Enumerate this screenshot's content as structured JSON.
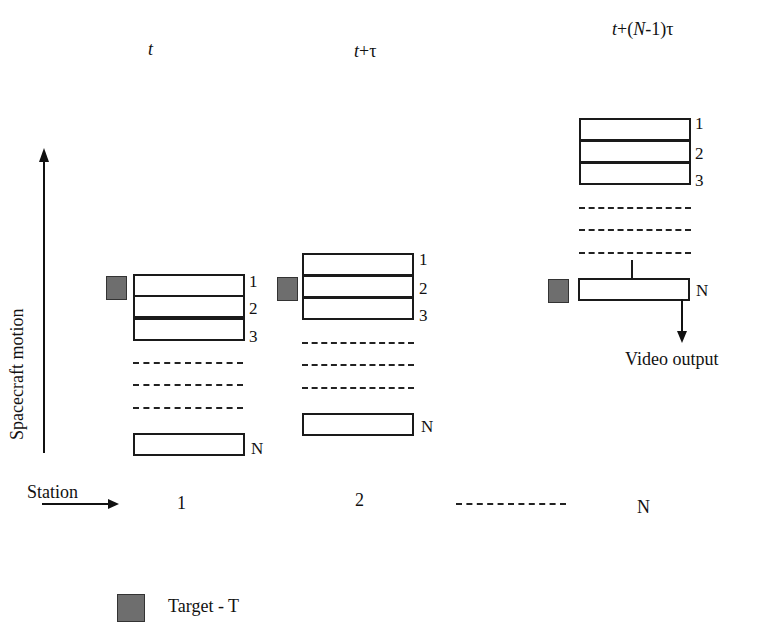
{
  "diagram": {
    "time_labels": [
      {
        "prefix": "t",
        "suffix": ""
      },
      {
        "prefix": "t",
        "suffix": "+τ"
      },
      {
        "prefix": "t+(",
        "mid": "N",
        "suffix": "-1)τ"
      }
    ],
    "axis_label": "Spacecraft motion",
    "station_label": "Station",
    "station_numbers": [
      "1",
      "2",
      "N"
    ],
    "row_labels": [
      "1",
      "2",
      "3",
      "N"
    ],
    "output_label": "Video output",
    "legend": {
      "label": "Target - T",
      "color": "#6e6e6e"
    },
    "colors": {
      "line": "#1a1a1a",
      "target": "#6e6e6e",
      "background": "#ffffff"
    }
  }
}
